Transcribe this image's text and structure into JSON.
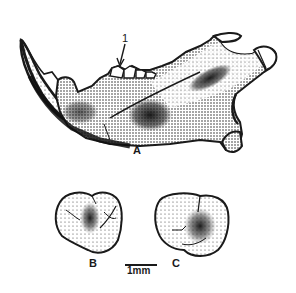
{
  "figure": {
    "labels": {
      "mandible": "A",
      "tooth_b": "B",
      "tooth_c": "C",
      "pointer": "1"
    },
    "scale_bar": {
      "label": "1mm"
    },
    "colors": {
      "ink": "#1a1a1a",
      "paper": "#ffffff",
      "stipple": "#555555"
    }
  }
}
